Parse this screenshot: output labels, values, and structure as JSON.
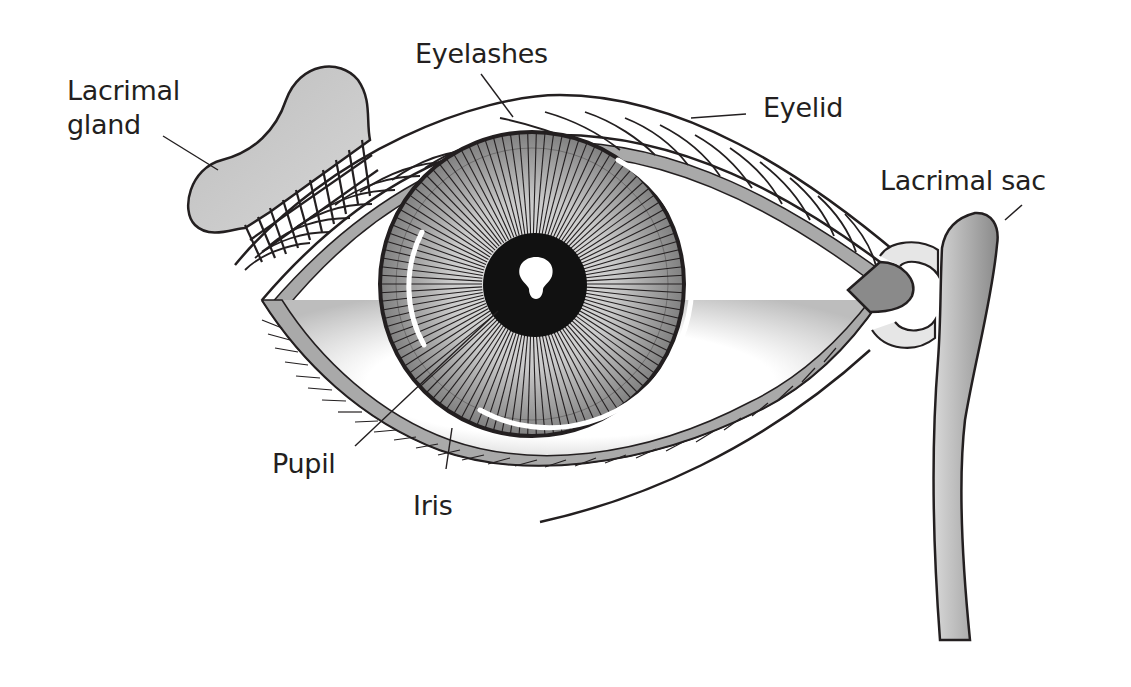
{
  "diagram": {
    "colors": {
      "outline": "#231f20",
      "text": "#231f20",
      "gray_fill": "#a8a8a8",
      "dark_gray": "#7d7d7d",
      "light_gray": "#d9d9d9",
      "pupil": "#111111",
      "background": "#ffffff"
    },
    "labels": [
      {
        "id": "lacrimal-gland",
        "text": "Lacrimal\ngland"
      },
      {
        "id": "eyelashes",
        "text": "Eyelashes"
      },
      {
        "id": "eyelid",
        "text": "Eyelid"
      },
      {
        "id": "lacrimal-sac",
        "text": "Lacrimal sac"
      },
      {
        "id": "pupil",
        "text": "Pupil"
      },
      {
        "id": "iris",
        "text": "Iris"
      }
    ]
  }
}
